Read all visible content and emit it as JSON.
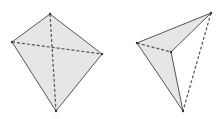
{
  "colors": {
    "fill": "#e6e6e6",
    "stroke": "#555555",
    "background": "#ffffff"
  },
  "figures": [
    {
      "name": "quadrilateral-with-diagonals",
      "vertices": {
        "top": [
          50,
          14
        ],
        "left": [
          12,
          42
        ],
        "right": [
          102,
          54
        ],
        "bottom": [
          56,
          111
        ]
      },
      "solid_edges": [
        [
          "top",
          "right"
        ],
        [
          "right",
          "bottom"
        ],
        [
          "bottom",
          "left"
        ],
        [
          "left",
          "top"
        ]
      ],
      "dashed_edges": [
        [
          "top",
          "bottom"
        ],
        [
          "left",
          "right"
        ]
      ]
    },
    {
      "name": "tetrahedron",
      "vertices": {
        "left": [
          137,
          43
        ],
        "top_right": [
          211,
          13
        ],
        "inner": [
          171,
          52
        ],
        "bottom": [
          183,
          111
        ]
      },
      "shaded_faces": [
        [
          "left",
          "top_right",
          "inner"
        ],
        [
          "left",
          "inner",
          "bottom"
        ]
      ],
      "solid_edges": [
        [
          "left",
          "top_right"
        ],
        [
          "top_right",
          "inner"
        ],
        [
          "inner",
          "bottom"
        ],
        [
          "left",
          "bottom"
        ]
      ],
      "dashed_edges": [
        [
          "left",
          "inner"
        ],
        [
          "top_right",
          "bottom"
        ]
      ]
    }
  ]
}
